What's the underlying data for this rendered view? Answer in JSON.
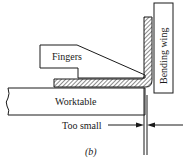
{
  "diagram": {
    "labels": {
      "fingers": "Fingers",
      "bending_wing": "Bending wing",
      "worktable": "Worktable",
      "gap": "Too small",
      "caption": "(b)"
    },
    "colors": {
      "stroke": "#1a1a1a",
      "background": "#ffffff"
    }
  }
}
